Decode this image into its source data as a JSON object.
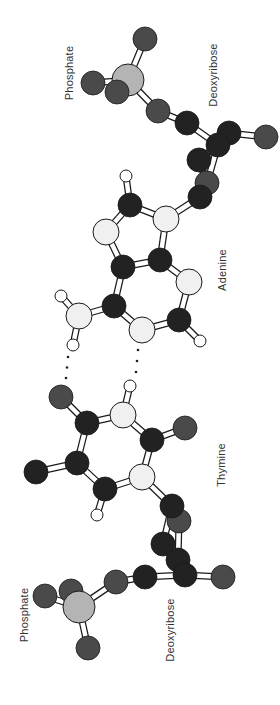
{
  "figure": {
    "labels": [
      {
        "id": "phosphate-top",
        "text": "Phosphate",
        "x": 69,
        "y": 73
      },
      {
        "id": "deoxyribose-top",
        "text": "Deoxyribose",
        "x": 213,
        "y": 75
      },
      {
        "id": "adenine",
        "text": "Adenine",
        "x": 222,
        "y": 270
      },
      {
        "id": "thymine",
        "text": "Thymine",
        "x": 221,
        "y": 465
      },
      {
        "id": "phosphate-bottom",
        "text": "Phosphate",
        "x": 24,
        "y": 615
      },
      {
        "id": "deoxyribose-bottom",
        "text": "Deoxyribose",
        "x": 170,
        "y": 630
      }
    ],
    "colors": {
      "C": "#222222",
      "O": "#4a4a4a",
      "N": "#f0f0f0",
      "H": "#ffffff",
      "P": "#b4b4b4",
      "outline": "#1a1a1a",
      "bond_fill": "#ffffff"
    },
    "radii": {
      "C": 12,
      "O": 12,
      "N": 13,
      "H": 6,
      "P": 16
    },
    "atoms": [
      {
        "id": "p1_O_top",
        "el": "O",
        "x": 145,
        "y": 39
      },
      {
        "id": "p1_O_left",
        "el": "O",
        "x": 93,
        "y": 83
      },
      {
        "id": "p1_P",
        "el": "P",
        "x": 128,
        "y": 80
      },
      {
        "id": "p1_O_front",
        "el": "O",
        "x": 117,
        "y": 92
      },
      {
        "id": "s1_O5",
        "el": "O",
        "x": 158,
        "y": 111
      },
      {
        "id": "s1_C5",
        "el": "C",
        "x": 187,
        "y": 123
      },
      {
        "id": "s1_C4b",
        "el": "C",
        "x": 229,
        "y": 133
      },
      {
        "id": "s1_O3",
        "el": "O",
        "x": 266,
        "y": 137
      },
      {
        "id": "s1_C3",
        "el": "C",
        "x": 199,
        "y": 160
      },
      {
        "id": "s1_C4",
        "el": "C",
        "x": 218,
        "y": 145
      },
      {
        "id": "s1_O4",
        "el": "O",
        "x": 207,
        "y": 183
      },
      {
        "id": "s1_C1",
        "el": "C",
        "x": 200,
        "y": 197
      },
      {
        "id": "a_H8",
        "el": "H",
        "x": 126,
        "y": 176
      },
      {
        "id": "a_C8",
        "el": "C",
        "x": 130,
        "y": 205
      },
      {
        "id": "a_N9",
        "el": "N",
        "x": 166,
        "y": 219
      },
      {
        "id": "a_N7",
        "el": "N",
        "x": 106,
        "y": 232
      },
      {
        "id": "a_C4",
        "el": "C",
        "x": 160,
        "y": 260
      },
      {
        "id": "a_C5",
        "el": "C",
        "x": 123,
        "y": 267
      },
      {
        "id": "a_N3",
        "el": "N",
        "x": 189,
        "y": 282
      },
      {
        "id": "a_H6a",
        "el": "H",
        "x": 61,
        "y": 296
      },
      {
        "id": "a_C6",
        "el": "C",
        "x": 114,
        "y": 306
      },
      {
        "id": "a_N6",
        "el": "N",
        "x": 79,
        "y": 316
      },
      {
        "id": "a_C2",
        "el": "C",
        "x": 179,
        "y": 320
      },
      {
        "id": "a_N1",
        "el": "N",
        "x": 142,
        "y": 330
      },
      {
        "id": "a_H2",
        "el": "H",
        "x": 200,
        "y": 341
      },
      {
        "id": "a_H6b",
        "el": "H",
        "x": 73,
        "y": 345
      },
      {
        "id": "t_H3",
        "el": "H",
        "x": 130,
        "y": 386
      },
      {
        "id": "t_O4",
        "el": "O",
        "x": 61,
        "y": 397
      },
      {
        "id": "t_N3",
        "el": "N",
        "x": 123,
        "y": 415
      },
      {
        "id": "t_C4",
        "el": "C",
        "x": 87,
        "y": 423
      },
      {
        "id": "t_O2",
        "el": "O",
        "x": 185,
        "y": 428
      },
      {
        "id": "t_C2",
        "el": "C",
        "x": 152,
        "y": 440
      },
      {
        "id": "t_C5",
        "el": "C",
        "x": 77,
        "y": 463
      },
      {
        "id": "t_CH3",
        "el": "C",
        "x": 36,
        "y": 472
      },
      {
        "id": "t_N1",
        "el": "N",
        "x": 142,
        "y": 477
      },
      {
        "id": "t_C6",
        "el": "C",
        "x": 105,
        "y": 489
      },
      {
        "id": "t_H6",
        "el": "H",
        "x": 97,
        "y": 515
      },
      {
        "id": "s2_O4",
        "el": "O",
        "x": 179,
        "y": 521
      },
      {
        "id": "s2_C1",
        "el": "C",
        "x": 172,
        "y": 506
      },
      {
        "id": "s2_C2",
        "el": "C",
        "x": 163,
        "y": 544
      },
      {
        "id": "s2_C3b",
        "el": "C",
        "x": 178,
        "y": 560
      },
      {
        "id": "s2_O3",
        "el": "O",
        "x": 223,
        "y": 577
      },
      {
        "id": "s2_C4",
        "el": "C",
        "x": 185,
        "y": 575
      },
      {
        "id": "s2_C5",
        "el": "C",
        "x": 145,
        "y": 577
      },
      {
        "id": "s2_O5",
        "el": "O",
        "x": 116,
        "y": 582
      },
      {
        "id": "p2_O_left",
        "el": "O",
        "x": 45,
        "y": 596
      },
      {
        "id": "p2_O_back",
        "el": "O",
        "x": 71,
        "y": 591
      },
      {
        "id": "p2_P",
        "el": "P",
        "x": 79,
        "y": 607
      },
      {
        "id": "p2_O_bottom",
        "el": "O",
        "x": 88,
        "y": 648
      }
    ],
    "bonds": [
      [
        "p1_P",
        "p1_O_top"
      ],
      [
        "p1_P",
        "p1_O_left"
      ],
      [
        "p1_P",
        "s1_O5"
      ],
      [
        "s1_O5",
        "s1_C5"
      ],
      [
        "s1_C5",
        "s1_C4"
      ],
      [
        "s1_C4b",
        "s1_O3"
      ],
      [
        "s1_C4",
        "s1_C4b"
      ],
      [
        "s1_C4",
        "s1_C3"
      ],
      [
        "s1_C3",
        "s1_O4"
      ],
      [
        "s1_C4",
        "s1_O4"
      ],
      [
        "s1_O4",
        "s1_C1"
      ],
      [
        "s1_C1",
        "a_N9"
      ],
      [
        "a_H8",
        "a_C8"
      ],
      [
        "a_C8",
        "a_N9"
      ],
      [
        "a_C8",
        "a_N7"
      ],
      [
        "a_N9",
        "a_C4"
      ],
      [
        "a_N7",
        "a_C5"
      ],
      [
        "a_C5",
        "a_C4"
      ],
      [
        "a_C4",
        "a_N3"
      ],
      [
        "a_C5",
        "a_C6"
      ],
      [
        "a_N3",
        "a_C2"
      ],
      [
        "a_C2",
        "a_N1"
      ],
      [
        "a_N1",
        "a_C6"
      ],
      [
        "a_C6",
        "a_N6"
      ],
      [
        "a_N6",
        "a_H6a"
      ],
      [
        "a_N6",
        "a_H6b"
      ],
      [
        "a_C2",
        "a_H2"
      ],
      [
        "t_H3",
        "t_N3"
      ],
      [
        "t_O4",
        "t_C4"
      ],
      [
        "t_C4",
        "t_N3"
      ],
      [
        "t_N3",
        "t_C2"
      ],
      [
        "t_C2",
        "t_O2"
      ],
      [
        "t_C4",
        "t_C5"
      ],
      [
        "t_C2",
        "t_N1"
      ],
      [
        "t_C5",
        "t_CH3"
      ],
      [
        "t_C5",
        "t_C6"
      ],
      [
        "t_N1",
        "t_C6"
      ],
      [
        "t_C6",
        "t_H6"
      ],
      [
        "t_N1",
        "s2_C1"
      ],
      [
        "s2_C1",
        "s2_O4"
      ],
      [
        "s2_C1",
        "s2_C2"
      ],
      [
        "s2_O4",
        "s2_C3b"
      ],
      [
        "s2_C2",
        "s2_C4"
      ],
      [
        "s2_C3b",
        "s2_C4"
      ],
      [
        "s2_C4",
        "s2_O3"
      ],
      [
        "s2_C4",
        "s2_C5"
      ],
      [
        "s2_C5",
        "s2_O5"
      ],
      [
        "s2_O5",
        "p2_P"
      ],
      [
        "p2_P",
        "p2_O_left"
      ],
      [
        "p2_P",
        "p2_O_bottom"
      ]
    ],
    "hydrogen_bonds": [
      {
        "from": [
          68,
          357
        ],
        "to": [
          66,
          378
        ],
        "dots": 3
      },
      {
        "from": [
          138,
          350
        ],
        "to": [
          136,
          372
        ],
        "dots": 3
      }
    ]
  }
}
